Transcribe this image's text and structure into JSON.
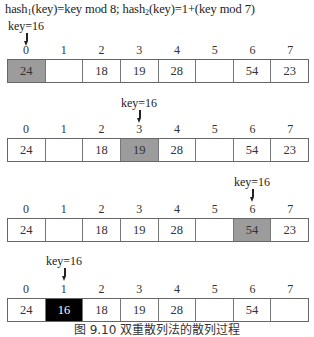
{
  "title": {
    "hash1_prefix": "hash",
    "hash1_sub": "1",
    "hash1_body": "(key)=key mod 8; ",
    "hash2_prefix": "hash",
    "hash2_sub": "2",
    "hash2_body": "(key)=1+(key mod 7)"
  },
  "indices": [
    "0",
    "1",
    "2",
    "3",
    "4",
    "5",
    "6",
    "7"
  ],
  "steps": [
    {
      "key_label": "key=16",
      "pointer_index": 0,
      "cells": [
        "24",
        "",
        "18",
        "19",
        "28",
        "",
        "54",
        "23"
      ],
      "highlight_index": 0,
      "highlight_type": "probe"
    },
    {
      "key_label": "key=16",
      "pointer_index": 3,
      "cells": [
        "24",
        "",
        "18",
        "19",
        "28",
        "",
        "54",
        "23"
      ],
      "highlight_index": 3,
      "highlight_type": "probe"
    },
    {
      "key_label": "key=16",
      "pointer_index": 6,
      "cells": [
        "24",
        "",
        "18",
        "19",
        "28",
        "",
        "54",
        "23"
      ],
      "highlight_index": 6,
      "highlight_type": "probe"
    },
    {
      "key_label": "key=16",
      "pointer_index": 1,
      "cells": [
        "24",
        "16",
        "18",
        "19",
        "28",
        "",
        "54",
        ""
      ],
      "highlight_index": 1,
      "highlight_type": "placed"
    }
  ],
  "caption": "图 9.10  双重散列法的散列过程",
  "colors": {
    "probe_fill": "#9c9c9c",
    "placed_fill": "#000000",
    "border": "#666666"
  }
}
